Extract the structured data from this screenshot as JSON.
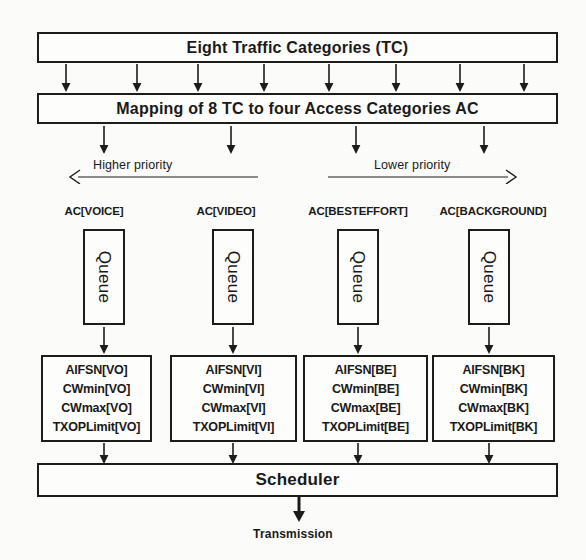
{
  "diagram": {
    "title_box": "Eight Traffic Categories (TC)",
    "mapping_box": "Mapping of 8 TC to four Access Categories AC",
    "scheduler_box": "Scheduler",
    "transmission_label": "Transmission",
    "priority": {
      "higher": "Higher priority",
      "lower": "Lower priority"
    },
    "queue_label": "Queue",
    "access_categories": [
      {
        "label": "AC[VOICE]",
        "queue": "Queue",
        "params": [
          "AIFSN[VO]",
          "CWmin[VO]",
          "CWmax[VO]",
          "TXOPLimit[VO]"
        ]
      },
      {
        "label": "AC[VIDEO]",
        "queue": "Queue",
        "params": [
          "AIFSN[VI]",
          "CWmin[VI]",
          "CWmax[VI]",
          "TXOPLimit[VI]"
        ]
      },
      {
        "label": "AC[BESTEFFORT]",
        "queue": "Queue",
        "params": [
          "AIFSN[BE]",
          "CWmin[BE]",
          "CWmax[BE]",
          "TXOPLimit[BE]"
        ]
      },
      {
        "label": "AC[BACKGROUND]",
        "queue": "Queue",
        "params": [
          "AIFSN[BK]",
          "CWmin[BK]",
          "CWmax[BK]",
          "TXOPLimit[BK]"
        ]
      }
    ],
    "colors": {
      "background": "#fbfbf9",
      "stroke": "#1c1c1c",
      "box_fill": "#fdfdfb",
      "text": "#1a1a1a"
    }
  }
}
